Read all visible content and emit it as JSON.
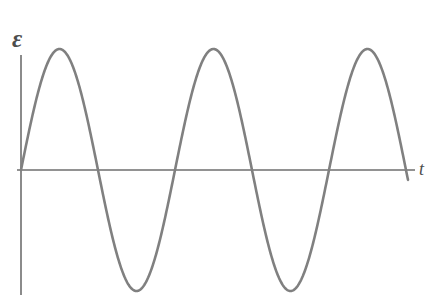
{
  "figure": {
    "width": 434,
    "height": 302,
    "background": "#ffffff"
  },
  "labels": {
    "y_axis": "ε",
    "x_axis": "t"
  },
  "colors": {
    "curve": "#808080",
    "axis": "#6e6e6e",
    "label": "#4d4d4d",
    "background": "#ffffff"
  },
  "chart_data": {
    "type": "line",
    "title": "",
    "subtitle": "",
    "xlabel": "t",
    "ylabel": "ε",
    "grid": false,
    "legend": null,
    "annotations": [],
    "xticks": [],
    "yticks": [],
    "axes": {
      "x_axis_y_pixel": 170,
      "x_axis_start_pixel": 17,
      "x_axis_end_pixel": 415,
      "y_axis_x_pixel": 21,
      "y_axis_top_pixel": 55,
      "y_axis_bottom_pixel": 295
    },
    "waveform": {
      "function": "sine",
      "equation": "ε(t) = A sin(2πt/T)",
      "amplitude": 121,
      "period": 154,
      "phase": 0,
      "cycles": 2.5,
      "start_x": 21,
      "end_x": 408,
      "baseline_y": 170,
      "peak_y": 49,
      "trough_y": 291,
      "stroke_width": 2.6
    },
    "key_points": {
      "zero_crossings_x": [
        21,
        98,
        175,
        252,
        329,
        406
      ],
      "peaks_x": [
        60,
        214,
        368
      ],
      "troughs_x": [
        137,
        291
      ]
    },
    "series": [
      {
        "name": "emf",
        "x": [
          0,
          0.125,
          0.25,
          0.375,
          0.5,
          0.625,
          0.75,
          0.875,
          1,
          1.125,
          1.25,
          1.375,
          1.5,
          1.625,
          1.75,
          1.875,
          2,
          2.125,
          2.25,
          2.375,
          2.5
        ],
        "values": [
          0,
          0.707,
          1,
          0.707,
          0,
          -0.707,
          -1,
          -0.707,
          0,
          0.707,
          1,
          0.707,
          0,
          -0.707,
          -1,
          -0.707,
          0,
          0.707,
          1,
          0.707,
          0
        ]
      }
    ],
    "xlim": [
      0,
      2.5
    ],
    "ylim": [
      -1,
      1
    ]
  }
}
